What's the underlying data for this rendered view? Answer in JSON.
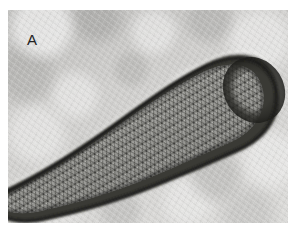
{
  "figure": {
    "kind": "electron-micrograph",
    "panel_label": "A",
    "canvas": {
      "width": 300,
      "height": 235,
      "background": "#ffffff"
    },
    "plate": {
      "x": 8,
      "y": 10,
      "width": 280,
      "height": 213
    }
  },
  "colors": {
    "page_background": "#ffffff",
    "micrograph_background": "#cecdcb",
    "background_light": "#e4e4e2",
    "background_dark": "#a8a8a6",
    "stain_rim_dark": "#272724",
    "stain_rim_mid": "#4a4a46",
    "lattice_fill": "#8e8e8a",
    "lattice_light": "#d4d4d0",
    "lattice_dark": "#1e1e1c",
    "panel_letter": "#232323"
  },
  "specimen": {
    "name": "rod-particle",
    "outline_points": "M -6,205 L -6,183 C 26,168 62,146 96,122 C 130,98 164,72 196,56 C 216,46 238,44 252,54 C 266,64 270,82 266,98 C 262,116 248,130 230,138 C 206,149 176,162 146,174 C 112,188 72,200 34,208 C 18,211 4,210 -6,205 Z",
    "core_points": "M -6,200 L -6,187 C 25,172 60,151 94,127 C 128,103 162,78 195,62 C 214,53 233,52 244,61 C 255,71 258,86 254,99 C 250,114 238,125 223,132 C 200,142 172,155 143,167 C 110,181 70,193 33,201 C 19,204 5,204 -6,200 Z",
    "cap": {
      "cx": 246,
      "cy": 80,
      "rx": 26,
      "ry": 30,
      "rotation": -32
    },
    "lattice": {
      "cell_size_px": 4.6,
      "symmetry": "triangular",
      "rows": 46,
      "cols": 72
    }
  }
}
